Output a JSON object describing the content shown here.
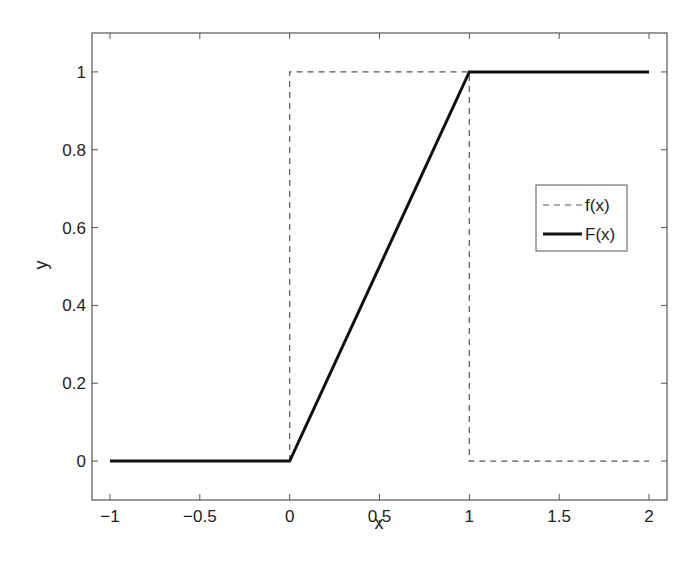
{
  "chart_data": {
    "type": "line",
    "title": "",
    "xlabel": "x",
    "ylabel": "y",
    "xlim": [
      -1.1,
      2.1
    ],
    "ylim": [
      -0.1,
      1.1
    ],
    "grid": false,
    "legend_position": "right-middle (inside)",
    "xticks": [
      -1,
      -0.5,
      0,
      0.5,
      1,
      1.5,
      2
    ],
    "xtick_labels": [
      "−1",
      "−0.5",
      "0",
      "0.5",
      "1",
      "1.5",
      "2"
    ],
    "yticks": [
      0,
      0.2,
      0.4,
      0.6,
      0.8,
      1
    ],
    "ytick_labels": [
      "0",
      "0.2",
      "0.4",
      "0.6",
      "0.8",
      "1"
    ],
    "series": [
      {
        "name": "f(x)",
        "style": "dashed",
        "color": "#555555",
        "x": [
          0,
          0,
          1,
          1,
          2
        ],
        "y": [
          0,
          1,
          1,
          0,
          0
        ]
      },
      {
        "name": "F(x)",
        "style": "solid-thick",
        "color": "#111111",
        "x": [
          -1,
          0,
          1,
          2
        ],
        "y": [
          0,
          0,
          1,
          1
        ]
      }
    ]
  },
  "legend": {
    "items": [
      "f(x)",
      "F(x)"
    ]
  },
  "axes": {
    "xlabel": "x",
    "ylabel": "y"
  }
}
